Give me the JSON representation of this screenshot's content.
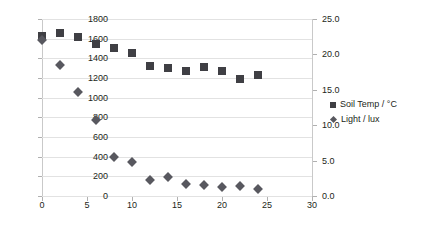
{
  "chart_data": {
    "type": "scatter",
    "title": "",
    "xlabel": "",
    "ylabel": "",
    "y2label": "",
    "grid": true,
    "legend_position": "right",
    "xlim": [
      0,
      30
    ],
    "xticks": [
      "0",
      "5",
      "10",
      "15",
      "20",
      "25",
      "30"
    ],
    "xtick_values": [
      0,
      5,
      10,
      15,
      20,
      25,
      30
    ],
    "ylim": [
      0,
      1800
    ],
    "yticks": [
      "0",
      "200",
      "400",
      "600",
      "800",
      "1000",
      "1200",
      "1400",
      "1600",
      "1800"
    ],
    "ytick_values": [
      0,
      200,
      400,
      600,
      800,
      1000,
      1200,
      1400,
      1600,
      1800
    ],
    "y2lim": [
      0,
      25
    ],
    "y2ticks": [
      "0.0",
      "5.0",
      "10.0",
      "15.0",
      "20.0",
      "25.0"
    ],
    "y2tick_values": [
      0,
      5,
      10,
      15,
      20,
      25
    ],
    "x": [
      0,
      2,
      4,
      6,
      8,
      10,
      12,
      14,
      16,
      18,
      20,
      22,
      24
    ],
    "series": [
      {
        "name": "Soil Temp / °C",
        "marker": "square",
        "color": "#3f3f44",
        "axis": "right",
        "values": [
          22.6,
          23.0,
          22.4,
          21.4,
          20.9,
          20.2,
          18.3,
          18.1,
          17.6,
          18.2,
          17.7,
          16.5,
          17.1
        ]
      },
      {
        "name": "Light / lux",
        "marker": "diamond",
        "color": "#58585f",
        "axis": "left",
        "values": [
          1590,
          1330,
          1060,
          775,
          400,
          345,
          165,
          190,
          120,
          110,
          95,
          105,
          75
        ]
      }
    ]
  },
  "legend": {
    "items": [
      {
        "label": "Soil Temp / °C",
        "marker": "square"
      },
      {
        "label": "Light / lux",
        "marker": "diamond"
      }
    ]
  }
}
